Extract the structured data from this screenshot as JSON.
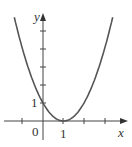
{
  "chart_data": {
    "type": "line",
    "title": "",
    "function": "y = (x - 1)^2",
    "xlabel": "x",
    "ylabel": "y",
    "tick_labels": {
      "origin": "0",
      "x": [
        "1"
      ],
      "y": [
        "1"
      ]
    },
    "x": [
      -1.4,
      -1,
      -0.5,
      0,
      0.5,
      1,
      1.5,
      2,
      2.5,
      3,
      3.4
    ],
    "series": [
      {
        "name": "parabola",
        "values": [
          5.76,
          4,
          2.25,
          1,
          0.25,
          0,
          0.25,
          1,
          2.25,
          4,
          5.76
        ]
      }
    ],
    "xlim": [
      -1.5,
      3.7
    ],
    "ylim": [
      -0.8,
      5.8
    ],
    "grid": false,
    "legend": null,
    "colors": {
      "curve": "#555555",
      "axes": "#444444"
    }
  },
  "labels": {
    "x_axis": "x",
    "y_axis": "y",
    "origin": "0",
    "x_tick_1": "1",
    "y_tick_1": "1"
  }
}
